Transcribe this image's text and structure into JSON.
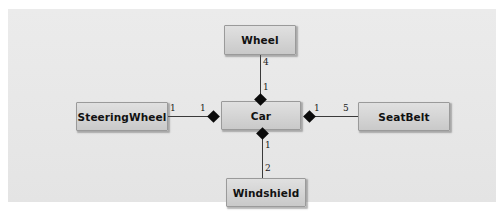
{
  "diagram": {
    "kind": "uml-class-diagram",
    "relationship_type": "composition",
    "canvas_color": "#e9e9e9",
    "box_fill_color": "#d6d6d6",
    "box_border_color": "#9a9a9a",
    "line_color": "#3a3a3a",
    "diamond_color": "#0b0b0b",
    "classes": {
      "car": "Car",
      "wheel": "Wheel",
      "steeringwheel": "SteeringWheel",
      "seatbelt": "SeatBelt",
      "windshield": "Windshield"
    },
    "relations": [
      {
        "whole": "Car",
        "part": "Wheel",
        "whole_multiplicity": "1",
        "part_multiplicity": "4",
        "marker": "filled-diamond"
      },
      {
        "whole": "Car",
        "part": "SteeringWheel",
        "whole_multiplicity": "1",
        "part_multiplicity": "1",
        "marker": "filled-diamond"
      },
      {
        "whole": "Car",
        "part": "SeatBelt",
        "whole_multiplicity": "1",
        "part_multiplicity": "5",
        "marker": "filled-diamond"
      },
      {
        "whole": "Car",
        "part": "Windshield",
        "whole_multiplicity": "1",
        "part_multiplicity": "2",
        "marker": "filled-diamond"
      }
    ],
    "multiplicity_labels": {
      "wheel_far": "4",
      "wheel_near": "1",
      "steering_far": "1",
      "steering_near": "1",
      "seatbelt_near": "1",
      "seatbelt_far": "5",
      "windshield_near": "1",
      "windshield_far": "2"
    }
  }
}
